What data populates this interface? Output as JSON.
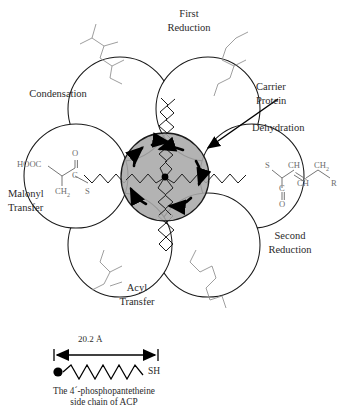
{
  "figure": {
    "title_absent": true,
    "center": {
      "name": "Carrier Protein",
      "callout_label_line1": "Carrier",
      "callout_label_line2": "Protein",
      "fill_color": "#a9a9a9",
      "stroke_color": "#1a1a1a",
      "hub_dot_color": "#000000",
      "rotation_arrow_count": 6
    },
    "domains": [
      {
        "id": "condensation",
        "label_line1": "Condensation",
        "label_line2": "",
        "position": "upper-left",
        "formula": "R-CH2-C(=O)-C(=O)-S-"
      },
      {
        "id": "first-reduction",
        "label_line1": "First",
        "label_line2": "Reduction",
        "position": "upper-right",
        "formula": "R-CH2-CH(OH)-C(=O)-S-"
      },
      {
        "id": "dehydration",
        "label_line1": "Dehydration",
        "label_line2": "",
        "position": "right",
        "formula": "-S-C(=O)-CH=CH-CH2-R"
      },
      {
        "id": "second-reduction",
        "label_line1": "Second",
        "label_line2": "Reduction",
        "position": "lower-right",
        "formula": "-S-C(=O)-CH2-CH2-CH2-R"
      },
      {
        "id": "acyl-transfer",
        "label_line1": "Acyl",
        "label_line2": "Transfer",
        "position": "lower-left",
        "formula": "R-CH2-C(=O)-S-"
      },
      {
        "id": "malonyl-transfer",
        "label_line1": "Malonyl",
        "label_line2": "Transfer",
        "position": "left",
        "formula": "HOOC-CH2-C(=O)-S-"
      }
    ],
    "malonyl_structure": {
      "hooc": "HOOC",
      "ch2": "CH",
      "ch2_sub": "2",
      "carbonyl_c": "C",
      "carbonyl_o": "O",
      "thiol_s": "S"
    },
    "dehydration_structure": {
      "thiol_s": "S",
      "carbonyl_c": "C",
      "carbonyl_o": "O",
      "ch_a": "CH",
      "ch_b": "CH",
      "ch2": "CH",
      "ch2_sub": "2",
      "r_group": "R"
    },
    "scale": {
      "value": "20.2 Å",
      "sh_label": "SH",
      "caption_line1": "The 4´-phosphopantetheine",
      "caption_line2": "side chain of ACP",
      "dot_color": "#000000"
    }
  }
}
